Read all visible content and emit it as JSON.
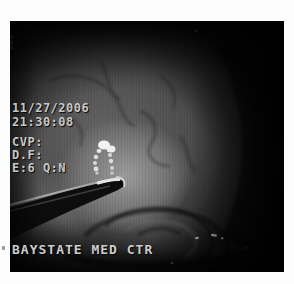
{
  "photo": {
    "osd": {
      "date": "11/27/2006",
      "time": "21:30:08",
      "line_cvp": "CVP:",
      "line_df": "D.F:",
      "line_e": "E:6 Q:N",
      "facility": "BAYSTATE MED CTR"
    },
    "colors": {
      "page_background": "#fdfdfd",
      "photo_background": "#000000",
      "osd_text": "#c6c6c6",
      "specular_highlight": "#f2f2f2"
    }
  }
}
